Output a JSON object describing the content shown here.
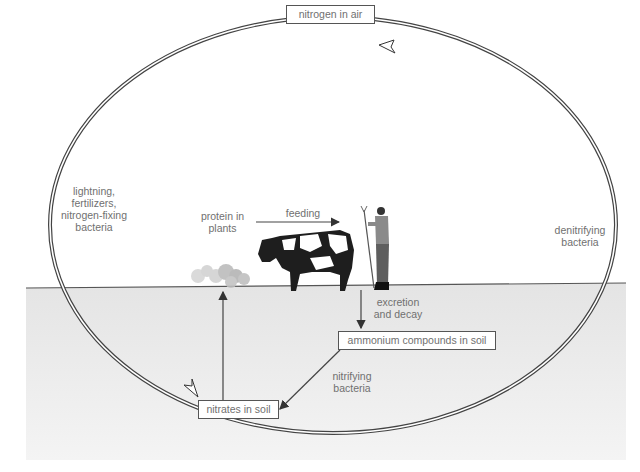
{
  "diagram": {
    "boxes": {
      "air": "nitrogen in air",
      "ammonium": "ammonium compounds in soil",
      "nitrates": "nitrates in soil"
    },
    "labels": {
      "fixation": [
        "lightning,",
        "fertilizers,",
        "nitrogen-fixing",
        "bacteria"
      ],
      "denitrifying": [
        "denitrifying",
        "bacteria"
      ],
      "protein": [
        "protein in",
        "plants"
      ],
      "feeding": "feeding",
      "excretion": [
        "excretion",
        "and decay"
      ],
      "nitrifying": [
        "nitrifying",
        "bacteria"
      ]
    },
    "colors": {
      "soil": "#e9e9e9",
      "line": "#444444",
      "text": "#707070"
    }
  }
}
